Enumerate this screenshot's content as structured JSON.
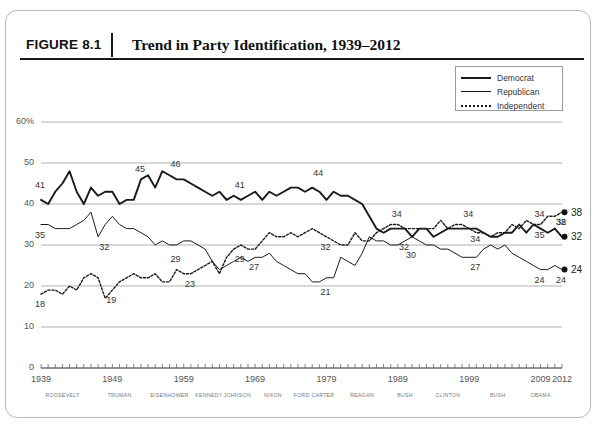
{
  "figure": {
    "number": "FIGURE 8.1",
    "title": "Trend in Party Identification, 1939–2012"
  },
  "legend": {
    "items": [
      {
        "label": "Democrat",
        "style": "solid-thick",
        "color": "#1a1a1a"
      },
      {
        "label": "Republican",
        "style": "solid-thin",
        "color": "#1a1a1a"
      },
      {
        "label": "Independent",
        "style": "dotted",
        "color": "#1a1a1a"
      }
    ]
  },
  "axes": {
    "y_ticks": [
      "60%",
      "50",
      "40",
      "30",
      "20",
      "10",
      "0"
    ],
    "x_ticks": [
      "1939",
      "1949",
      "1959",
      "1969",
      "1979",
      "1989",
      "1999",
      "2009",
      "2012"
    ],
    "presidents": [
      "ROOSEVELT",
      "TRUMAN",
      "EISENHOWER",
      "KENNEDY",
      "JOHNSON",
      "NIXON",
      "FORD",
      "CARTER",
      "REAGAN",
      "BUSH",
      "CLINTON",
      "BUSH",
      "OBAMA"
    ]
  },
  "chart_data": {
    "type": "line",
    "title": "Trend in Party Identification, 1939–2012",
    "xlabel": "",
    "ylabel": "",
    "xlim": [
      1939,
      2012
    ],
    "ylim": [
      0,
      60
    ],
    "grid": "horizontal",
    "legend_position": "top-right",
    "x": [
      1939,
      1940,
      1941,
      1942,
      1943,
      1944,
      1945,
      1946,
      1947,
      1948,
      1949,
      1950,
      1951,
      1952,
      1953,
      1954,
      1955,
      1956,
      1957,
      1958,
      1959,
      1960,
      1961,
      1962,
      1963,
      1964,
      1965,
      1966,
      1967,
      1968,
      1969,
      1970,
      1971,
      1972,
      1973,
      1974,
      1975,
      1976,
      1977,
      1978,
      1979,
      1980,
      1981,
      1982,
      1983,
      1984,
      1985,
      1986,
      1987,
      1988,
      1989,
      1990,
      1991,
      1992,
      1993,
      1994,
      1995,
      1996,
      1997,
      1998,
      1999,
      2000,
      2001,
      2002,
      2003,
      2004,
      2005,
      2006,
      2007,
      2008,
      2009,
      2010,
      2011,
      2012
    ],
    "series": [
      {
        "name": "Democrat",
        "style": "solid-thick",
        "values": [
          41,
          40,
          43,
          45,
          48,
          43,
          40,
          44,
          42,
          43,
          43,
          40,
          41,
          41,
          46,
          47,
          44,
          48,
          47,
          46,
          46,
          45,
          44,
          43,
          42,
          43,
          41,
          42,
          41,
          42,
          43,
          41,
          43,
          42,
          43,
          44,
          44,
          43,
          44,
          43,
          41,
          43,
          42,
          42,
          41,
          40,
          37,
          34,
          33,
          34,
          34,
          34,
          32,
          34,
          34,
          32,
          33,
          34,
          34,
          34,
          34,
          34,
          33,
          32,
          32,
          33,
          33,
          35,
          33,
          35,
          34,
          33,
          34,
          32
        ]
      },
      {
        "name": "Republican",
        "style": "solid-thin",
        "values": [
          35,
          35,
          34,
          34,
          34,
          35,
          36,
          38,
          32,
          35,
          37,
          35,
          34,
          34,
          33,
          32,
          30,
          31,
          30,
          30,
          31,
          31,
          30,
          29,
          26,
          24,
          25,
          26,
          27,
          26,
          27,
          27,
          28,
          26,
          25,
          24,
          23,
          23,
          21,
          21,
          22,
          22,
          27,
          26,
          25,
          28,
          32,
          31,
          31,
          30,
          30,
          31,
          32,
          31,
          30,
          30,
          29,
          29,
          28,
          27,
          27,
          27,
          29,
          30,
          29,
          30,
          28,
          27,
          26,
          25,
          24,
          24,
          25,
          24
        ]
      },
      {
        "name": "Independent",
        "style": "dotted",
        "values": [
          18,
          19,
          19,
          18,
          20,
          19,
          22,
          23,
          22,
          17,
          19,
          21,
          22,
          23,
          22,
          22,
          23,
          21,
          21,
          24,
          23,
          23,
          24,
          25,
          26,
          23,
          27,
          29,
          30,
          29,
          29,
          31,
          33,
          32,
          32,
          33,
          32,
          33,
          34,
          33,
          32,
          31,
          30,
          30,
          33,
          31,
          31,
          33,
          34,
          35,
          35,
          34,
          34,
          34,
          34,
          34,
          36,
          34,
          35,
          35,
          34,
          33,
          33,
          32,
          33,
          33,
          35,
          34,
          36,
          35,
          35,
          37,
          37,
          38
        ]
      }
    ],
    "point_labels": [
      {
        "series": "Democrat",
        "year": 1939,
        "value": 41
      },
      {
        "series": "Democrat",
        "year": 1953,
        "value": 45
      },
      {
        "series": "Democrat",
        "year": 1958,
        "value": 46
      },
      {
        "series": "Democrat",
        "year": 1967,
        "value": 41
      },
      {
        "series": "Democrat",
        "year": 1978,
        "value": 44
      },
      {
        "series": "Democrat",
        "year": 1989,
        "value": 34
      },
      {
        "series": "Democrat",
        "year": 1999,
        "value": 34
      },
      {
        "series": "Democrat",
        "year": 2009,
        "value": 34
      },
      {
        "series": "Democrat",
        "year": 2012,
        "value": 32
      },
      {
        "series": "Republican",
        "year": 1939,
        "value": 35
      },
      {
        "series": "Republican",
        "year": 1948,
        "value": 32
      },
      {
        "series": "Republican",
        "year": 1958,
        "value": 29
      },
      {
        "series": "Republican",
        "year": 1969,
        "value": 27
      },
      {
        "series": "Republican",
        "year": 1979,
        "value": 21
      },
      {
        "series": "Republican",
        "year": 1991,
        "value": 30
      },
      {
        "series": "Republican",
        "year": 2000,
        "value": 27
      },
      {
        "series": "Republican",
        "year": 2009,
        "value": 24
      },
      {
        "series": "Republican",
        "year": 2012,
        "value": 24
      },
      {
        "series": "Independent",
        "year": 1939,
        "value": 18
      },
      {
        "series": "Independent",
        "year": 1949,
        "value": 19
      },
      {
        "series": "Independent",
        "year": 1960,
        "value": 23
      },
      {
        "series": "Independent",
        "year": 1967,
        "value": 29
      },
      {
        "series": "Independent",
        "year": 1979,
        "value": 32
      },
      {
        "series": "Independent",
        "year": 1990,
        "value": 32
      },
      {
        "series": "Independent",
        "year": 2000,
        "value": 34
      },
      {
        "series": "Independent",
        "year": 2009,
        "value": 35
      },
      {
        "series": "Independent",
        "year": 2012,
        "value": 38
      }
    ],
    "end_markers": [
      {
        "series": "Independent",
        "value": 38
      },
      {
        "series": "Democrat",
        "value": 32
      },
      {
        "series": "Republican",
        "value": 24
      }
    ]
  }
}
